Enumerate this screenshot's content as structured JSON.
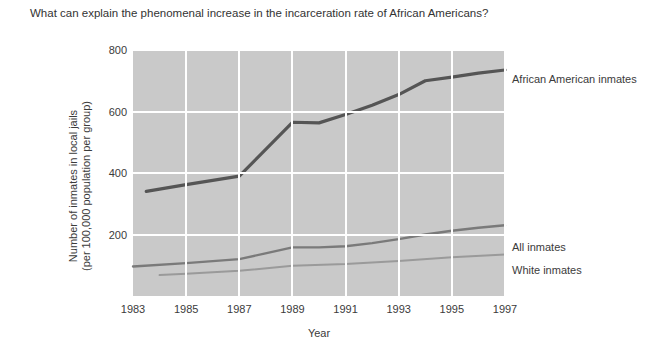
{
  "question": {
    "text": "What can explain the phenomenal increase in the incarceration rate of African Americans?"
  },
  "axes": {
    "xlabel": "Year",
    "ylabel_line1": "Number of inmates in local jails",
    "ylabel_line2": "(per 100,000 population per group)",
    "yticks": [
      "200",
      "400",
      "600",
      "800"
    ],
    "xticks": [
      "1983",
      "1985",
      "1987",
      "1989",
      "1991",
      "1993",
      "1995",
      "1997"
    ]
  },
  "legend": {
    "african_american": "African American inmates",
    "all": "All inmates",
    "white": "White inmates"
  },
  "colors": {
    "plot_background": "#c9c9c9",
    "gridline": "#ffffff",
    "african_american_line": "#555555",
    "all_inmates_line": "#7a7a7a",
    "white_inmates_line": "#9a9a9a",
    "text": "#3b3b3b"
  },
  "chart_data": {
    "type": "line",
    "title": "",
    "xlabel": "Year",
    "ylabel": "Number of inmates in local jails (per 100,000 population per group)",
    "xlim": [
      1983,
      1997
    ],
    "ylim": [
      0,
      800
    ],
    "yticks": [
      200,
      400,
      600,
      800
    ],
    "xticks": [
      1983,
      1985,
      1987,
      1989,
      1991,
      1993,
      1995,
      1997
    ],
    "grid": true,
    "legend_position": "right-of-plot-inline",
    "series": [
      {
        "name": "African American inmates",
        "color": "#555555",
        "x": [
          1983.5,
          1985,
          1987,
          1989,
          1990,
          1991,
          1992,
          1993,
          1994,
          1995,
          1996,
          1997
        ],
        "values": [
          340,
          362,
          390,
          565,
          563,
          590,
          620,
          655,
          700,
          712,
          725,
          735
        ]
      },
      {
        "name": "All inmates",
        "color": "#7a7a7a",
        "x": [
          1983,
          1985,
          1987,
          1989,
          1990,
          1991,
          1992,
          1993,
          1994,
          1995,
          1996,
          1997
        ],
        "values": [
          96,
          107,
          120,
          158,
          158,
          162,
          172,
          185,
          200,
          212,
          222,
          230
        ]
      },
      {
        "name": "White inmates",
        "color": "#9a9a9a",
        "x": [
          1984,
          1985,
          1987,
          1989,
          1991,
          1993,
          1995,
          1997
        ],
        "values": [
          68,
          72,
          82,
          98,
          104,
          114,
          126,
          135
        ]
      }
    ]
  }
}
